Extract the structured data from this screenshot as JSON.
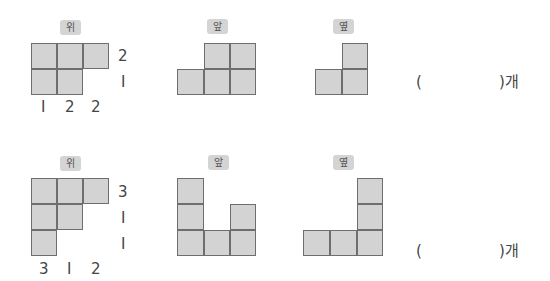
{
  "problems": [
    {
      "top_label": "위",
      "front_label": "앞",
      "side_label": "옆",
      "row_numbers": [
        "2",
        "I"
      ],
      "col_numbers": [
        "I",
        "2",
        "2"
      ],
      "answer_open": "(",
      "answer_close": ")개"
    },
    {
      "top_label": "위",
      "front_label": "앞",
      "side_label": "옆",
      "row_numbers": [
        "3",
        "I",
        "I"
      ],
      "col_numbers": [
        "3",
        "I",
        "2"
      ],
      "answer_open": "(",
      "answer_close": ")개"
    }
  ],
  "colors": {
    "cell_fill": "#d3d3d3",
    "cell_border": "#6e6e6e",
    "label_bg": "#d4d4d4"
  }
}
